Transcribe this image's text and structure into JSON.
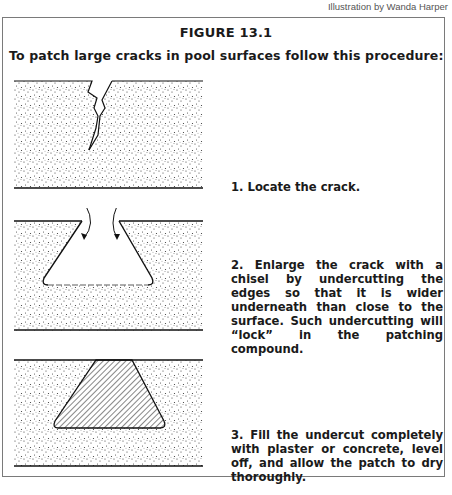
{
  "credit": "Illustration by Wanda Harper",
  "figure": {
    "title": "FIGURE 13.1",
    "intro": "To patch large cracks in pool surfaces follow this procedure:",
    "steps": [
      {
        "text": "1. Locate the crack.",
        "illustration": "crack-in-surface"
      },
      {
        "text": "2. Enlarge the crack with a chisel by undercutting the edges so that it is wider underneath than close to the surface. Such undercutting will “lock” in the patching compound.",
        "illustration": "undercut-cavity"
      },
      {
        "text": "3. Fill the undercut completely with plaster or concrete, level off, and allow the patch to dry thoroughly.",
        "illustration": "filled-patch"
      }
    ]
  }
}
